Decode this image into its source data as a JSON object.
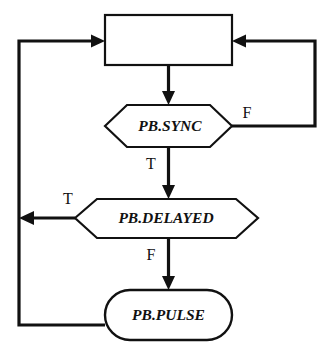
{
  "diagram": {
    "type": "flowchart",
    "width": 336,
    "height": 349,
    "background_color": "#ffffff",
    "line_color": "#111111",
    "nodes": [
      {
        "id": "top-process",
        "shape": "rectangle",
        "label": "",
        "x": 105,
        "y": 15,
        "width": 127,
        "height": 50
      },
      {
        "id": "pb-sync",
        "shape": "hexagon",
        "label": "PB.SYNC",
        "x": 105,
        "y": 105,
        "width": 127,
        "height": 42
      },
      {
        "id": "pb-delayed",
        "shape": "hexagon",
        "label": "PB.DELAYED",
        "x": 75,
        "y": 199,
        "width": 183,
        "height": 40
      },
      {
        "id": "pb-pulse",
        "shape": "stadium",
        "label": "PB.PULSE",
        "x": 105,
        "y": 290,
        "width": 127,
        "height": 50
      }
    ],
    "edges": [
      {
        "id": "edge-top-to-sync",
        "from": "top-process",
        "to": "pb-sync",
        "label": "",
        "arrow": true
      },
      {
        "id": "edge-sync-false",
        "from": "pb-sync",
        "to": "top-process",
        "label": "F",
        "arrow": true,
        "route": "right"
      },
      {
        "id": "edge-sync-true",
        "from": "pb-sync",
        "to": "pb-delayed",
        "label": "T",
        "arrow": true
      },
      {
        "id": "edge-delayed-true",
        "from": "pb-delayed",
        "to": "top-process",
        "label": "T",
        "arrow": true,
        "route": "left"
      },
      {
        "id": "edge-delayed-false",
        "from": "pb-delayed",
        "to": "pb-pulse",
        "label": "F",
        "arrow": true
      },
      {
        "id": "edge-pulse-to-top",
        "from": "pb-pulse",
        "to": "top-process",
        "label": "",
        "arrow": false,
        "route": "left"
      }
    ],
    "labels": {
      "sync_false": "F",
      "sync_true": "T",
      "delayed_true": "T",
      "delayed_false": "F"
    },
    "node_labels": {
      "top_process": "",
      "pb_sync": "PB.SYNC",
      "pb_delayed": "PB.DELAYED",
      "pb_pulse": "PB.PULSE"
    }
  }
}
